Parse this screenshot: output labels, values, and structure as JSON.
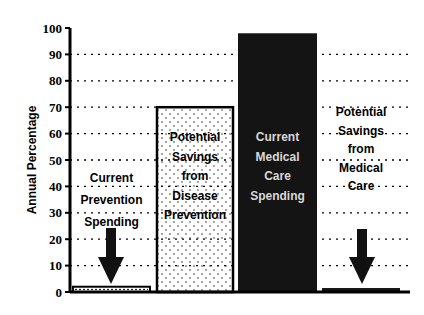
{
  "chart_data": {
    "type": "bar",
    "title": "",
    "xlabel": "",
    "ylabel": "Annual Percentage",
    "ylim": [
      0,
      100
    ],
    "yticks": [
      0,
      10,
      20,
      30,
      40,
      50,
      60,
      70,
      80,
      90,
      100
    ],
    "grid": "horizontal dotted",
    "legend": "none",
    "categories": [
      "Current Prevention Spending",
      "Potential Savings from Disease Prevention",
      "Current Medical Care Spending",
      "Potential Savings from Medical Care"
    ],
    "values": [
      2,
      70,
      98,
      1.5
    ],
    "bar_labels": [
      [
        "Current",
        "Prevention",
        "Spending"
      ],
      [
        "Potential",
        "Savings",
        "from",
        "Disease",
        "Prevention"
      ],
      [
        "Current",
        "Medical",
        "Care",
        "Spending"
      ],
      [
        "Potential",
        "Savings",
        "from",
        "Medical",
        "Care"
      ]
    ],
    "bar_styles": [
      "white-hatched",
      "white-dotted",
      "black",
      "black"
    ],
    "annotations": [
      "down-arrow over bar 1",
      "down-arrow over bar 4"
    ]
  },
  "colors": {
    "axis": "#000000",
    "dark_bar": "#141414",
    "light_bar": "#ffffff",
    "dark_label": "#d8d8d8"
  }
}
